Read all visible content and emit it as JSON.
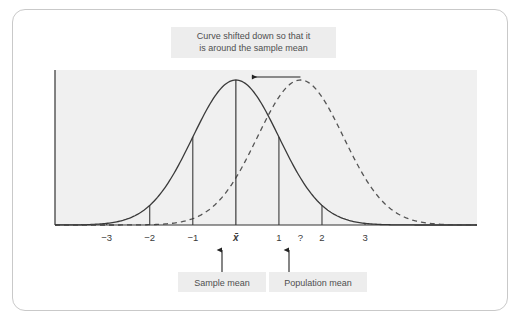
{
  "figure": {
    "top_caption": {
      "line1": "Curve shifted down so that it",
      "line2": "is around the sample mean"
    },
    "bottom_callouts": [
      {
        "label": "Sample mean",
        "points_to": "x-bar"
      },
      {
        "label": "Population mean",
        "points_to": "?"
      }
    ],
    "colors": {
      "plot_background": "#f0f0f0",
      "label_box": "#ededed",
      "curve_solid": "#3a3a3a",
      "curve_dashed": "#555555",
      "axis": "#333333",
      "text": "#4f4f4f",
      "card_border": "#c9c9c9"
    }
  },
  "chart_data": {
    "type": "line",
    "title": "Curve shifted down so that it is around the sample mean",
    "xlabel": "",
    "ylabel": "",
    "grid": false,
    "legend": "none",
    "xlim": [
      -4.2,
      5.6
    ],
    "ylim": [
      0,
      1.05
    ],
    "axis_ticks": [
      {
        "label": "−3",
        "z": -3
      },
      {
        "label": "−2",
        "z": -2
      },
      {
        "label": "−1",
        "z": -1
      },
      {
        "label": "x̄",
        "z": 0
      },
      {
        "label": "1",
        "z": 1
      },
      {
        "label": "?",
        "z": 1.5
      },
      {
        "label": "2",
        "z": 2
      },
      {
        "label": "3",
        "z": 3
      }
    ],
    "series": [
      {
        "name": "Sampling distribution around sample mean",
        "style": "solid",
        "mean": 0,
        "sd": 1,
        "peak_label": "x̄",
        "description": "Normal curve centered on the sample mean"
      },
      {
        "name": "Sampling distribution around population mean",
        "style": "dashed",
        "mean": 1.5,
        "sd": 1,
        "peak_label": "?",
        "description": "Normal curve centered on the unknown population mean"
      }
    ],
    "annotations": [
      {
        "text": "Curve shifted down so that it is around the sample mean",
        "kind": "caption-box",
        "position": "top-center"
      },
      {
        "text": "Sample mean",
        "kind": "callout-box",
        "position": "bottom",
        "target_z": 0
      },
      {
        "text": "Population mean",
        "kind": "callout-box",
        "position": "bottom",
        "target_z": 1.5
      },
      {
        "text": "",
        "kind": "shift-arrow",
        "direction": "left",
        "from_z": 1.5,
        "to_z": 0,
        "description": "Arrow showing the curve shifting left from population mean to sample mean"
      }
    ],
    "vertical_markers": [
      {
        "z": -3,
        "from": "axis",
        "to": "curve_solid"
      },
      {
        "z": -2,
        "from": "axis",
        "to": "curve_solid"
      },
      {
        "z": -1,
        "from": "axis",
        "to": "curve_solid"
      },
      {
        "z": 0,
        "from": "axis",
        "to": "curve_solid_peak"
      },
      {
        "z": 1,
        "from": "axis",
        "to": "curve_solid"
      },
      {
        "z": 2,
        "from": "axis",
        "to": "curve_solid"
      },
      {
        "z": 3,
        "from": "axis",
        "to": "curve_solid"
      }
    ]
  }
}
